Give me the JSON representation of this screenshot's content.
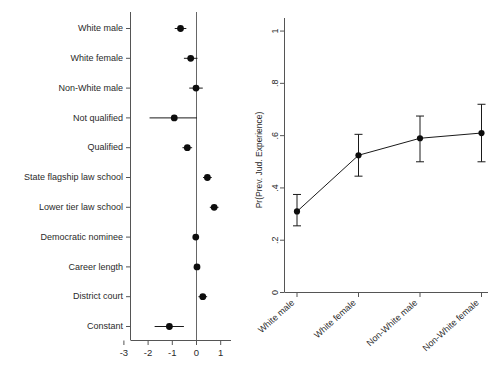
{
  "figure": {
    "background": "#ffffff",
    "line_color": "#444444",
    "marker_color": "#111111",
    "text_color": "#2a2a2a"
  },
  "chart_data": [
    {
      "type": "scatter",
      "name": "coefficient-plot",
      "title": "",
      "xlabel": "",
      "ylabel": "",
      "xlim": [
        -3.4,
        1.4
      ],
      "xticks": [
        -3,
        -2,
        -1,
        0,
        1
      ],
      "xticklabels": [
        "-3",
        "-2",
        "-1",
        "0",
        "1"
      ],
      "grid": false,
      "reference_line": 0,
      "orientation": "horizontal",
      "categories": [
        "White male",
        "White female",
        "Non-White male",
        "Not qualified",
        "Qualified",
        "State flagship law school",
        "Lower tier law school",
        "Democratic nominee",
        "Career length",
        "District court",
        "Constant"
      ],
      "values": [
        -0.66,
        -0.24,
        -0.02,
        -0.92,
        -0.38,
        0.45,
        0.73,
        -0.03,
        0.02,
        0.26,
        -1.12
      ],
      "ci_low": [
        -0.9,
        -0.52,
        -0.3,
        -1.94,
        -0.58,
        0.27,
        0.55,
        -0.13,
        -0.02,
        0.08,
        -1.73
      ],
      "ci_high": [
        -0.42,
        0.04,
        0.26,
        0.02,
        -0.18,
        0.63,
        0.91,
        0.07,
        0.06,
        0.44,
        -0.52
      ]
    },
    {
      "type": "line",
      "name": "predicted-probability-plot",
      "title": "",
      "xlabel": "",
      "ylabel": "Pr(Prev. Jud. Experience)",
      "ylim": [
        0,
        1.05
      ],
      "yticks": [
        0,
        0.2,
        0.4,
        0.6,
        0.8,
        1
      ],
      "yticklabels": [
        "0",
        ".2",
        ".4",
        ".6",
        ".8",
        "1"
      ],
      "grid": false,
      "markers": true,
      "error_bars": true,
      "categories": [
        "White male",
        "White female",
        "Non-White male",
        "Non-White female"
      ],
      "values": [
        0.31,
        0.525,
        0.59,
        0.61
      ],
      "ci_low": [
        0.255,
        0.445,
        0.5,
        0.5
      ],
      "ci_high": [
        0.375,
        0.605,
        0.675,
        0.72
      ]
    }
  ]
}
